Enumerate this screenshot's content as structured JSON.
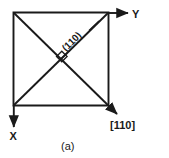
{
  "figure": {
    "caption": "(a)",
    "axes": [
      {
        "name": "y-axis",
        "label": "Y",
        "direction": "right"
      },
      {
        "name": "x-axis",
        "label": "X",
        "direction": "down"
      }
    ],
    "direction_vector": {
      "label": "[110]",
      "description": "arrow along the diagonal from top-left to bottom-right"
    },
    "plane_label": {
      "label": "(110)",
      "rotation_deg": -45,
      "description": "label along the diagonal from bottom-left to top-right"
    },
    "right_angle_marker": {
      "label": "right-angle-marker",
      "description": "small square where the two diagonals cross"
    },
    "square": {
      "label": "crystal-square",
      "description": "square outline of the crystal face"
    },
    "colors": {
      "ink": "#1a1a1a",
      "background": "#ffffff"
    }
  }
}
